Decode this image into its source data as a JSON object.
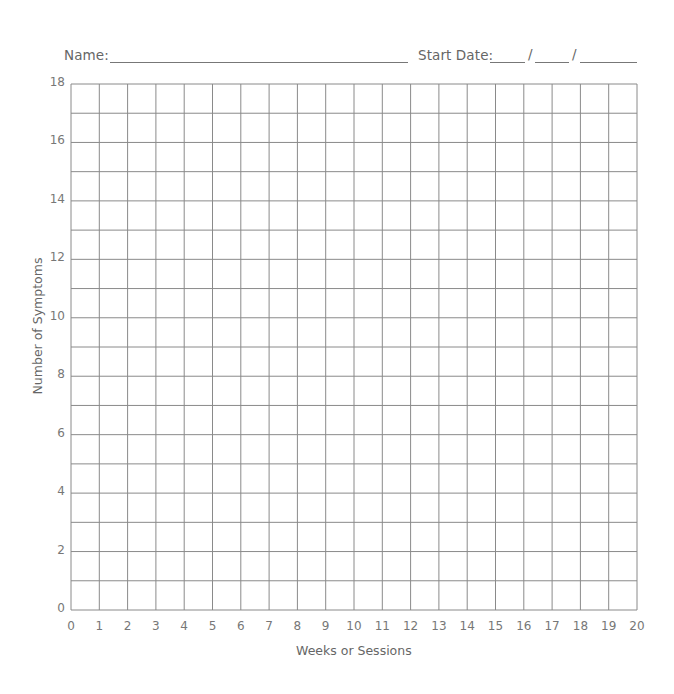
{
  "header": {
    "name_label": "Name:",
    "start_date_label": "Start Date:",
    "date_separator": "/"
  },
  "colors": {
    "grid_line": "#8a8a8a",
    "text": "#6b6b6b",
    "background": "#ffffff"
  },
  "chart_data": {
    "type": "line",
    "title": "",
    "xlabel": "Weeks or Sessions",
    "ylabel": "Number of Symptoms",
    "x_ticks": [
      "0",
      "1",
      "2",
      "3",
      "4",
      "5",
      "6",
      "7",
      "8",
      "9",
      "10",
      "11",
      "12",
      "13",
      "14",
      "15",
      "16",
      "17",
      "18",
      "19",
      "20"
    ],
    "y_ticks": [
      "0",
      "2",
      "4",
      "6",
      "8",
      "10",
      "12",
      "14",
      "16",
      "18"
    ],
    "xlim": [
      0,
      20
    ],
    "ylim": [
      0,
      18
    ],
    "x_grid_step": 1,
    "y_grid_step": 1,
    "grid": true,
    "legend": null,
    "series": []
  }
}
